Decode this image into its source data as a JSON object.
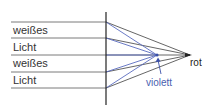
{
  "diagram": {
    "incoming_labels": [
      "weißes",
      "Licht",
      "weißes",
      "Licht"
    ],
    "focus_labels": {
      "red": "rot",
      "violet": "violett"
    },
    "colors": {
      "red_rays": "#555555",
      "violet_rays": "#4a5fb0",
      "lens": "#222222",
      "incoming_rays": "#777777"
    },
    "ray_heights_y": [
      22,
      38,
      55,
      72,
      88
    ],
    "lens_x": 106,
    "red_focus": {
      "x": 190,
      "y": 55
    },
    "violet_focus": {
      "x": 157,
      "y": 55
    }
  }
}
